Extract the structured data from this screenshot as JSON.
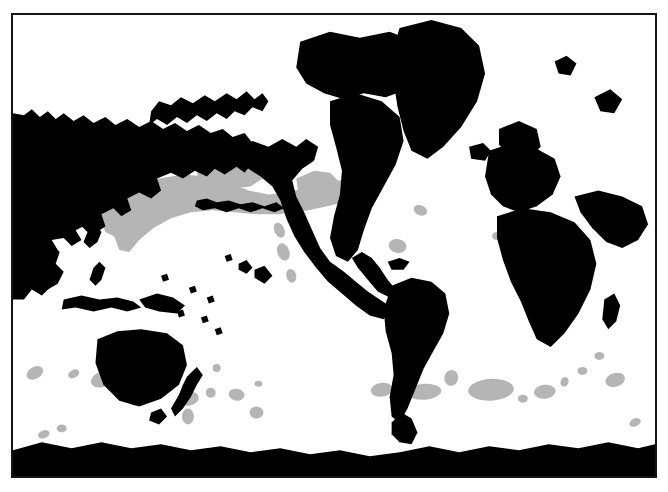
{
  "figure": {
    "kind": "world-distribution-map",
    "projection": "pacific-centred-cylindrical",
    "frame": {
      "x": 11,
      "y": 13,
      "width": 646,
      "height": 465,
      "border_color": "#141414",
      "border_width": 2
    },
    "background_color": "#ffffff",
    "land_color": "#000000",
    "range_color": "#b5b5b5",
    "caption": ""
  },
  "legend": {
    "land_label": "land",
    "range_label": "distribution"
  },
  "map_data": {
    "type": "choropleth-silhouette",
    "land_features": [
      {
        "name": "asia-eurasia-west",
        "d": "M11,112 L11,300 L22,300 L30,290 L40,296 L48,288 L44,276 L52,268 L46,258 L56,250 L50,240 L62,238 L70,246 L80,240 L74,230 L86,224 L96,232 L104,226 L100,214 L112,208 L120,216 L130,210 L126,198 L138,192 L150,198 L160,190 L156,178 L170,172 L182,178 L194,170 L206,176 L214,168 L224,174 L236,166 L244,172 L252,162 L244,152 L252,142 L244,132 L232,136 L222,128 L210,132 L198,124 L186,130 L174,122 L162,128 L150,120 L138,126 L126,118 L114,124 L104,116 L92,122 L82,114 L72,120 L62,112 L54,118 L46,110 L38,116 L30,108 L22,114 Z"
      },
      {
        "name": "siberia-kamchatka-coast",
        "d": "M150,110 L158,100 L170,104 L180,96 L192,102 L204,94 L214,100 L226,92 L236,98 L246,90 L254,98 L262,92 L268,100 L262,110 L252,106 L244,114 L234,110 L226,118 L216,112 L206,120 L196,114 L186,122 L176,116 L166,124 L156,118 L148,124 Z"
      },
      {
        "name": "japan-archipelago",
        "d": "M84,218 L92,210 L98,214 L94,224 L100,232 L96,242 L88,248 L82,242 L86,232 L80,226 Z"
      },
      {
        "name": "korea-china-coast",
        "d": "M46,210 L56,204 L66,210 L62,222 L52,228 L44,222 Z"
      },
      {
        "name": "se-asia-indochina",
        "d": "M40,250 L50,244 L58,252 L54,264 L62,272 L56,284 L46,290 L38,282 L42,270 L34,262 Z"
      },
      {
        "name": "philippines",
        "d": "M92,268 L98,262 L104,268 L100,280 L94,286 L88,280 Z"
      },
      {
        "name": "indonesia-sumatra-java",
        "d": "M62,300 L80,296 L98,300 L116,298 L132,302 L140,308 L126,312 L110,308 L92,312 L74,308 L60,310 Z"
      },
      {
        "name": "new-guinea",
        "d": "M138,300 L156,294 L172,298 L184,306 L176,314 L158,312 L144,308 Z"
      },
      {
        "name": "australia",
        "d": "M96,340 L116,332 L140,330 L166,334 L182,346 L186,366 L178,386 L160,400 L138,408 L118,402 L102,386 L94,364 Z"
      },
      {
        "name": "tasmania",
        "d": "M150,414 L160,410 L166,418 L158,426 L148,422 Z"
      },
      {
        "name": "new-zealand",
        "d": "M186,378 L196,368 L202,376 L196,386 L190,398 L182,410 L174,418 L170,410 L178,396 L182,386 Z"
      },
      {
        "name": "alaska-northamerica-west",
        "d": "M236,150 L252,140 L268,146 L282,138 L296,146 L306,138 L318,146 L314,160 L302,168 L292,180 L296,196 L304,212 L312,230 L320,248 L330,262 L344,272 L356,282 L368,292 L380,300 L392,308 L384,320 L370,316 L356,306 L342,294 L328,282 L316,268 L304,252 L294,236 L286,218 L280,200 L272,186 L260,176 L248,168 L238,162 Z"
      },
      {
        "name": "canada-arctic-archipelago",
        "d": "M300,40 L330,30 L360,36 L390,30 L416,40 L430,56 L426,76 L408,88 L386,96 L364,92 L344,98 L324,92 L306,82 L296,66 Z"
      },
      {
        "name": "greenland",
        "d": "M400,26 L432,18 L462,26 L480,44 L486,72 L478,100 L462,126 L444,146 L428,158 L412,150 L404,130 L398,106 L394,80 L392,52 Z"
      },
      {
        "name": "iceland",
        "d": "M470,146 L484,142 L492,150 L486,160 L472,158 Z"
      },
      {
        "name": "north-america-east",
        "d": "M330,100 L356,92 L382,100 L400,116 L404,140 L396,164 L384,186 L372,208 L364,230 L358,250 L348,262 L336,256 L330,238 L334,216 L340,194 L342,170 L336,146 L330,124 Z"
      },
      {
        "name": "central-america",
        "d": "M352,258 L362,252 L372,258 L380,268 L388,280 L396,290 L390,298 L378,292 L368,280 L358,268 Z"
      },
      {
        "name": "caribbean-islands",
        "d": "M388,262 L400,258 L410,262 L404,270 L392,270 Z"
      },
      {
        "name": "south-america",
        "d": "M392,286 L412,278 L432,282 L446,294 L450,314 L444,334 L434,352 L424,370 L416,390 L408,410 L400,424 L392,418 L390,398 L394,376 L392,354 L386,332 L384,310 Z"
      },
      {
        "name": "europe",
        "d": "M490,150 L514,142 L538,148 L556,158 L562,176 L554,194 L538,206 L520,212 L504,206 L492,194 L486,176 Z"
      },
      {
        "name": "scandinavia-britain",
        "d": "M500,128 L520,120 L538,128 L542,146 L530,158 L512,156 L500,144 Z"
      },
      {
        "name": "africa",
        "d": "M498,216 L524,208 L552,212 L576,222 L592,240 L598,264 L592,290 L580,314 L566,334 L552,348 L538,340 L530,322 L522,302 L512,282 L504,260 L498,238 Z"
      },
      {
        "name": "madagascar",
        "d": "M606,300 L616,294 L622,306 L618,322 L610,330 L604,320 Z"
      },
      {
        "name": "middle-east-india",
        "d": "M576,196 L600,190 L624,196 L644,206 L650,224 L640,240 L624,248 L608,242 L594,228 L582,212 Z"
      },
      {
        "name": "antarctica",
        "d": "M11,452 L40,444 L70,450 L100,444 L130,450 L160,446 L190,452 L220,448 L250,454 L280,450 L310,456 L340,452 L370,458 L400,454 L430,448 L460,454 L490,448 L520,452 L550,446 L580,450 L610,444 L640,450 L657,446 L657,478 L11,478 Z"
      },
      {
        "name": "antarctic-peninsula",
        "d": "M392,424 L402,414 L412,420 L418,434 L412,446 L400,444 L392,436 Z"
      },
      {
        "name": "aleutian-island-chain",
        "d": "M196,200 L206,198 L216,202 L228,200 L240,204 L252,202 L264,206 L276,202 L284,208 L274,212 L262,208 L250,212 L238,208 L226,212 L214,208 L202,210 L194,206 Z"
      },
      {
        "name": "hawaii-islands",
        "d": "M224,256 L230,254 L232,260 L226,262 Z M238,264 L246,260 L252,268 L246,274 L238,270 Z M254,270 L264,266 L272,276 L264,284 L254,278 Z"
      },
      {
        "name": "pacific-micronesia-dots",
        "d": "M160,276 L166,274 L168,280 L162,282 Z M188,288 L194,286 L196,292 L190,294 Z M206,298 L212,296 L214,302 L208,304 Z M176,312 L182,310 L184,316 L178,318 Z M200,318 L206,316 L208,322 L202,324 Z M214,330 L220,328 L222,334 L216,336 Z"
      },
      {
        "name": "svalbard-novaya-zemlya",
        "d": "M556,60 L568,54 L578,62 L572,74 L560,72 Z M596,96 L612,88 L624,98 L616,112 L602,110 Z"
      },
      {
        "name": "faroe-britain-isles",
        "d": "M530,172 L540,166 L548,176 L542,188 L530,184 Z"
      }
    ],
    "range_patches": [
      {
        "name": "north-pacific-subarctic-band",
        "type": "path",
        "d": "M120,198 L136,186 L158,178 L182,174 L206,176 L228,182 L248,190 L268,194 L288,192 L308,186 L326,180 L344,180 L356,186 L352,198 L336,204 L318,208 L298,212 L278,214 L256,214 L234,212 L212,210 L190,212 L170,218 L152,228 L138,240 L128,252 L118,250 L112,234 L114,214 Z"
      },
      {
        "name": "bering-sea-lobe",
        "type": "path",
        "d": "M196,172 L214,164 L234,162 L252,168 L262,178 L250,186 L232,188 L212,184 L198,180 Z"
      },
      {
        "name": "gulf-of-alaska-lobe",
        "type": "path",
        "d": "M296,178 L314,170 L330,172 L340,182 L332,192 L314,196 L298,192 Z"
      },
      {
        "name": "nw-pacific-japan-lobe",
        "type": "path",
        "d": "M104,206 L120,198 L134,202 L138,216 L130,230 L116,238 L104,232 L98,218 Z"
      },
      {
        "name": "california-current",
        "type": "ellipse",
        "cx": 283,
        "cy": 252,
        "rx": 6,
        "ry": 9,
        "rot": -20
      },
      {
        "name": "baja-offshore",
        "type": "ellipse",
        "cx": 291,
        "cy": 276,
        "rx": 5,
        "ry": 7,
        "rot": -15
      },
      {
        "name": "pacific-nw-coastal",
        "type": "ellipse",
        "cx": 279,
        "cy": 230,
        "rx": 5,
        "ry": 8,
        "rot": -25
      },
      {
        "name": "sargasso-bermuda",
        "type": "ellipse",
        "cx": 398,
        "cy": 246,
        "rx": 9,
        "ry": 7,
        "rot": 10
      },
      {
        "name": "newfoundland-shelf",
        "type": "ellipse",
        "cx": 421,
        "cy": 210,
        "rx": 7,
        "ry": 5,
        "rot": 25
      },
      {
        "name": "tasman-sea-west",
        "type": "ellipse",
        "cx": 102,
        "cy": 380,
        "rx": 13,
        "ry": 8,
        "rot": -20
      },
      {
        "name": "great-australian-bight",
        "type": "ellipse",
        "cx": 72,
        "cy": 375,
        "rx": 6,
        "ry": 4,
        "rot": -30
      },
      {
        "name": "indian-ocean-sw-aus",
        "type": "ellipse",
        "cx": 33,
        "cy": 374,
        "rx": 9,
        "ry": 6,
        "rot": -30
      },
      {
        "name": "south-tasman",
        "type": "ellipse",
        "cx": 42,
        "cy": 436,
        "rx": 6,
        "ry": 4,
        "rot": -20
      },
      {
        "name": "southern-ocean-pacific-1",
        "type": "ellipse",
        "cx": 60,
        "cy": 430,
        "rx": 5,
        "ry": 4,
        "rot": 0
      },
      {
        "name": "chatham-rise",
        "type": "ellipse",
        "cx": 188,
        "cy": 400,
        "rx": 10,
        "ry": 7,
        "rot": -10
      },
      {
        "name": "sub-antarctic-nz",
        "type": "ellipse",
        "cx": 187,
        "cy": 418,
        "rx": 6,
        "ry": 8,
        "rot": 0
      },
      {
        "name": "campbell-plateau",
        "type": "ellipse",
        "cx": 210,
        "cy": 394,
        "rx": 5,
        "ry": 5,
        "rot": 0
      },
      {
        "name": "bounty-trough",
        "type": "ellipse",
        "cx": 236,
        "cy": 396,
        "rx": 8,
        "ry": 6,
        "rot": 10
      },
      {
        "name": "south-pacific-open-1",
        "type": "ellipse",
        "cx": 256,
        "cy": 414,
        "rx": 7,
        "ry": 6,
        "rot": 0
      },
      {
        "name": "south-pacific-open-2",
        "type": "ellipse",
        "cx": 133,
        "cy": 403,
        "rx": 5,
        "ry": 4,
        "rot": 0
      },
      {
        "name": "south-pacific-open-3",
        "type": "ellipse",
        "cx": 258,
        "cy": 385,
        "rx": 4,
        "ry": 3,
        "rot": 0
      },
      {
        "name": "humboldt-offshore",
        "type": "ellipse",
        "cx": 382,
        "cy": 391,
        "rx": 11,
        "ry": 7,
        "rot": -8
      },
      {
        "name": "scotia-sea-west",
        "type": "ellipse",
        "cx": 425,
        "cy": 393,
        "rx": 17,
        "ry": 8,
        "rot": -4
      },
      {
        "name": "south-atlantic-mid",
        "type": "ellipse",
        "cx": 452,
        "cy": 379,
        "rx": 7,
        "ry": 8,
        "rot": 10
      },
      {
        "name": "south-georgia-blob",
        "type": "ellipse",
        "cx": 492,
        "cy": 391,
        "rx": 23,
        "ry": 11,
        "rot": -3
      },
      {
        "name": "south-atlantic-small-1",
        "type": "ellipse",
        "cx": 524,
        "cy": 400,
        "rx": 5,
        "ry": 4,
        "rot": 0
      },
      {
        "name": "agulhas-retroflection",
        "type": "ellipse",
        "cx": 546,
        "cy": 393,
        "rx": 11,
        "ry": 7,
        "rot": -6
      },
      {
        "name": "south-africa-offshore",
        "type": "ellipse",
        "cx": 584,
        "cy": 372,
        "rx": 5,
        "ry": 4,
        "rot": 0
      },
      {
        "name": "se-indian-ridge-1",
        "type": "ellipse",
        "cx": 566,
        "cy": 383,
        "rx": 4,
        "ry": 5,
        "rot": 20
      },
      {
        "name": "crozet-plateau",
        "type": "ellipse",
        "cx": 617,
        "cy": 381,
        "rx": 10,
        "ry": 7,
        "rot": -15
      },
      {
        "name": "kerguelen-plateau",
        "type": "ellipse",
        "cx": 601,
        "cy": 357,
        "rx": 5,
        "ry": 4,
        "rot": 0
      },
      {
        "name": "indian-southern-small",
        "type": "ellipse",
        "cx": 637,
        "cy": 424,
        "rx": 6,
        "ry": 4,
        "rot": -25
      },
      {
        "name": "north-atlantic-azores",
        "type": "ellipse",
        "cx": 498,
        "cy": 236,
        "rx": 5,
        "ry": 4,
        "rot": 0
      },
      {
        "name": "coral-sea-offshore",
        "type": "ellipse",
        "cx": 216,
        "cy": 369,
        "rx": 4,
        "ry": 4,
        "rot": 0
      }
    ],
    "axis_labels": {
      "x": "longitude",
      "y": "latitude"
    },
    "grid": false
  }
}
